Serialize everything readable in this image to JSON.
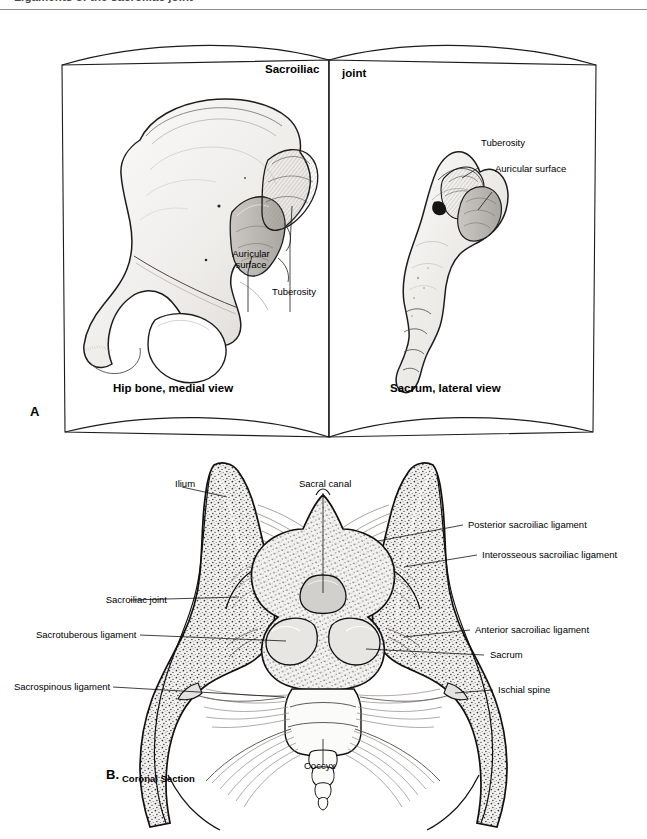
{
  "running_head": {
    "text": "Ligaments of the sacroiliac joint"
  },
  "figure": {
    "panel_a": {
      "letter": "A",
      "title_left": "Sacroiliac",
      "title_right": "joint",
      "caption_left": "Hip bone, medial view",
      "caption_right": "Sacrum, lateral view",
      "labels_left": [
        {
          "text": "Auricular\nsurface"
        },
        {
          "text": "Tuberosity"
        }
      ],
      "labels_right": [
        {
          "text": "Tuberosity"
        },
        {
          "text": "Auricular surface"
        }
      ]
    },
    "panel_b": {
      "letter": "B.",
      "caption": "Coronal Section",
      "labels": [
        {
          "text": "Ilium"
        },
        {
          "text": "Sacral canal"
        },
        {
          "text": "Posterior sacroiliac ligament"
        },
        {
          "text": "Interosseous sacroiliac ligament"
        },
        {
          "text": "Sacroiliac joint"
        },
        {
          "text": "Anterior sacroiliac ligament"
        },
        {
          "text": "Sacrotuberous ligament"
        },
        {
          "text": "Sacrum"
        },
        {
          "text": "Sacrospinous ligament"
        },
        {
          "text": "Ischial spine"
        },
        {
          "text": "Coccyx"
        }
      ]
    }
  },
  "colors": {
    "ink": "#000000",
    "rule": "#8c8c8c",
    "running_head_text": "#4a4a4a",
    "bone_fill": "#f4f3f1",
    "bone_shade": "#d8d6d2",
    "cancellous": "#efeeec",
    "page_fill": "#ffffff"
  }
}
